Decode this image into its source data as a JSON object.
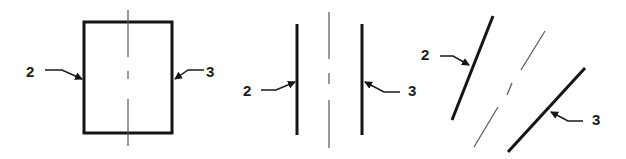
{
  "diagram": {
    "panels": [
      {
        "name": "rectangle-section",
        "labels": [
          {
            "text": "2",
            "x": 26,
            "y": 77
          },
          {
            "text": "3",
            "x": 206,
            "y": 77
          }
        ]
      },
      {
        "name": "parallel-vertical-lines",
        "labels": [
          {
            "text": "2",
            "x": 243,
            "y": 96
          },
          {
            "text": "3",
            "x": 408,
            "y": 96
          }
        ]
      },
      {
        "name": "parallel-inclined-lines",
        "labels": [
          {
            "text": "2",
            "x": 421,
            "y": 60
          },
          {
            "text": "3",
            "x": 592,
            "y": 125
          }
        ]
      }
    ]
  },
  "colors": {
    "line": "#151515",
    "centerline": "#555555",
    "background": "#ffffff"
  }
}
